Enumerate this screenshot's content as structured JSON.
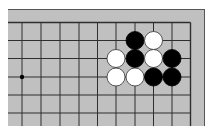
{
  "diagram": {
    "type": "go-board-fragment",
    "region": "top-right corner",
    "colors": {
      "board": "#c0c0c0",
      "line": "#2e2e2e",
      "border": "#555555",
      "black_stone": "#000000",
      "white_stone": "#ffffff",
      "white_stone_outline": "#333333"
    },
    "grid": {
      "x": [
        22,
        41,
        60,
        79,
        97.5,
        116,
        135,
        153.5,
        172,
        190.5
      ],
      "y": [
        22.5,
        40.5,
        58.5,
        77,
        95,
        113
      ],
      "right_edge_col": 9,
      "top_edge_row": 0
    },
    "star_points": [
      {
        "col": 0,
        "row": 3
      }
    ],
    "stones": [
      {
        "color": "black",
        "col": 6,
        "row": 1
      },
      {
        "color": "white",
        "col": 7,
        "row": 1
      },
      {
        "color": "white",
        "col": 5,
        "row": 2
      },
      {
        "color": "black",
        "col": 6,
        "row": 2
      },
      {
        "color": "white",
        "col": 7,
        "row": 2
      },
      {
        "color": "black",
        "col": 8,
        "row": 2
      },
      {
        "color": "white",
        "col": 5,
        "row": 3
      },
      {
        "color": "white",
        "col": 6,
        "row": 3
      },
      {
        "color": "black",
        "col": 7,
        "row": 3
      },
      {
        "color": "black",
        "col": 8,
        "row": 3
      }
    ]
  }
}
